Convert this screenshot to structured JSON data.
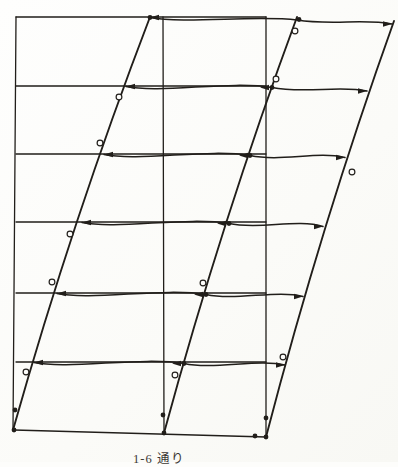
{
  "figure": {
    "caption": "1-6 通り",
    "colors": {
      "ink": "#211e1a",
      "paper": "#fdfdfb"
    },
    "undeformed": {
      "columns": [
        {
          "x1": 16,
          "y1": 17,
          "x2": 13,
          "y2": 430
        },
        {
          "x1": 163,
          "y1": 17,
          "x2": 164,
          "y2": 433
        },
        {
          "x1": 266,
          "y1": 17,
          "x2": 266,
          "y2": 437
        }
      ],
      "floor_levels": [
        17,
        86,
        154,
        222,
        293,
        362
      ],
      "floor_x1": 16,
      "floor_x2": 266,
      "base_line": {
        "x1": 14,
        "y1": 430,
        "x2": 266,
        "y2": 437
      }
    },
    "deformed": {
      "columns": [
        "M13,430 Q73,218 150,17",
        "M164,433 Q222,220 297,17",
        "M266,437 Q322,222 394,21"
      ],
      "beams": [
        "M150,17.5 C185,24 255,15 297,20 C330,25.5 365,18.5 392,24",
        "M126,86.5 C161,93.5 230,80.5 272,87.5 C304,94 340,85 367,91",
        "M104,154.5 C139,161.5 209,148.5 250,155.5 C281,162 317,151 345,157.5",
        "M82,222.5 C117,229.5 187,216.5 229,223.5 C259,230 297,218.5 323,226.5",
        "M57,293.5 C92,300.5 164,287.5 206,294.5 C236,301 277,289.5 303,296.5",
        "M34,362.5 C69,369.5 142,356.5 184,363.5 C214,370 258,358.5 285,365"
      ],
      "arrows_left": [
        [
          150,
          17.5
        ],
        [
          126,
          86.5
        ],
        [
          104,
          154.5
        ],
        [
          82,
          222.5
        ],
        [
          57,
          293.5
        ],
        [
          34,
          362.5
        ],
        [
          260,
          87.5
        ],
        [
          239,
          155.5
        ],
        [
          217,
          223.5
        ],
        [
          194,
          294.5
        ],
        [
          172,
          363.5
        ]
      ],
      "arrows_right": [
        [
          392,
          24
        ],
        [
          367,
          91
        ],
        [
          345,
          157.5
        ],
        [
          323,
          226.5
        ],
        [
          303,
          296.5
        ],
        [
          285,
          365
        ]
      ],
      "joint_dots": [
        [
          150,
          17.5
        ],
        [
          299,
          19.5
        ],
        [
          14,
          430
        ],
        [
          164,
          433
        ],
        [
          266,
          437
        ],
        [
          255,
          436
        ],
        [
          15,
          410
        ],
        [
          163,
          415
        ],
        [
          266,
          418
        ],
        [
          272,
          87.5
        ],
        [
          250,
          155.5
        ],
        [
          229,
          223.5
        ],
        [
          206,
          294.5
        ],
        [
          184,
          363.5
        ]
      ],
      "hinge_circles": [
        [
          119,
          97
        ],
        [
          100,
          143
        ],
        [
          70,
          234
        ],
        [
          52,
          282
        ],
        [
          26,
          372
        ],
        [
          295,
          31
        ],
        [
          276,
          79
        ],
        [
          203,
          283
        ],
        [
          175,
          375
        ],
        [
          352,
          172
        ],
        [
          283,
          357
        ]
      ]
    }
  }
}
